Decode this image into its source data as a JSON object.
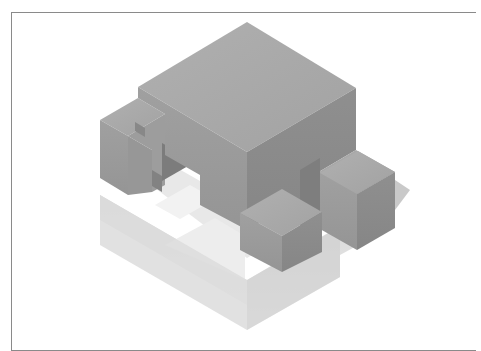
{
  "illustration": {
    "subject": "isometric-block-structure",
    "colors": {
      "background": "#ffffff",
      "frame_border": "#8a8a8a",
      "top_face": "#a9a9a9",
      "left_face": "#9a9a9a",
      "right_face": "#8c8c8c",
      "reflection_light": "#e6e6e6",
      "reflection_mid": "#d6d6d6",
      "reflection_dark": "#cacaca",
      "shadow": "#bdbdbd"
    }
  }
}
